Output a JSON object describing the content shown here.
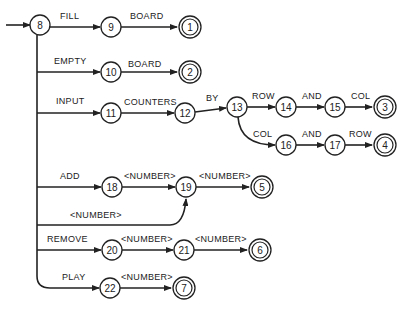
{
  "diagram": {
    "type": "state-transition-network",
    "start_node": "8",
    "nodes": [
      {
        "id": "8",
        "x": 40,
        "y": 25,
        "final": false
      },
      {
        "id": "9",
        "x": 111,
        "y": 27,
        "final": false
      },
      {
        "id": "1",
        "x": 190,
        "y": 27,
        "final": true
      },
      {
        "id": "10",
        "x": 111,
        "y": 72,
        "final": false
      },
      {
        "id": "2",
        "x": 190,
        "y": 72,
        "final": true
      },
      {
        "id": "11",
        "x": 111,
        "y": 113,
        "final": false
      },
      {
        "id": "12",
        "x": 185,
        "y": 113,
        "final": false
      },
      {
        "id": "13",
        "x": 237,
        "y": 107,
        "final": false
      },
      {
        "id": "14",
        "x": 286,
        "y": 107,
        "final": false
      },
      {
        "id": "15",
        "x": 335,
        "y": 107,
        "final": false
      },
      {
        "id": "3",
        "x": 385,
        "y": 107,
        "final": true
      },
      {
        "id": "16",
        "x": 286,
        "y": 145,
        "final": false
      },
      {
        "id": "17",
        "x": 335,
        "y": 145,
        "final": false
      },
      {
        "id": "4",
        "x": 385,
        "y": 145,
        "final": true
      },
      {
        "id": "18",
        "x": 112,
        "y": 187,
        "final": false
      },
      {
        "id": "19",
        "x": 186,
        "y": 187,
        "final": false
      },
      {
        "id": "5",
        "x": 262,
        "y": 187,
        "final": true
      },
      {
        "id": "20",
        "x": 112,
        "y": 250,
        "final": false
      },
      {
        "id": "21",
        "x": 184,
        "y": 250,
        "final": false
      },
      {
        "id": "6",
        "x": 260,
        "y": 250,
        "final": true
      },
      {
        "id": "22",
        "x": 110,
        "y": 288,
        "final": false
      },
      {
        "id": "7",
        "x": 184,
        "y": 288,
        "final": true
      }
    ],
    "edges": [
      {
        "from": "8",
        "to": "9",
        "label": "FILL"
      },
      {
        "from": "9",
        "to": "1",
        "label": "BOARD"
      },
      {
        "from": "8",
        "to": "10",
        "label": "EMPTY"
      },
      {
        "from": "10",
        "to": "2",
        "label": "BOARD"
      },
      {
        "from": "8",
        "to": "11",
        "label": "INPUT"
      },
      {
        "from": "11",
        "to": "12",
        "label": "COUNTERS"
      },
      {
        "from": "12",
        "to": "13",
        "label": "BY"
      },
      {
        "from": "13",
        "to": "14",
        "label": "ROW"
      },
      {
        "from": "14",
        "to": "15",
        "label": "AND"
      },
      {
        "from": "15",
        "to": "3",
        "label": "COL"
      },
      {
        "from": "13",
        "to": "16",
        "label": "COL"
      },
      {
        "from": "16",
        "to": "17",
        "label": "AND"
      },
      {
        "from": "17",
        "to": "4",
        "label": "ROW"
      },
      {
        "from": "8",
        "to": "18",
        "label": "ADD"
      },
      {
        "from": "18",
        "to": "19",
        "label": "<NUMBER>"
      },
      {
        "from": "19",
        "to": "5",
        "label": "<NUMBER>"
      },
      {
        "from": "8",
        "to": "19",
        "label": "<NUMBER>"
      },
      {
        "from": "8",
        "to": "20",
        "label": "REMOVE"
      },
      {
        "from": "20",
        "to": "21",
        "label": "<NUMBER>"
      },
      {
        "from": "21",
        "to": "6",
        "label": "<NUMBER>"
      },
      {
        "from": "8",
        "to": "22",
        "label": "PLAY"
      },
      {
        "from": "22",
        "to": "7",
        "label": "<NUMBER>"
      }
    ]
  },
  "style": {
    "stroke": "#222222",
    "background": "#ffffff"
  }
}
